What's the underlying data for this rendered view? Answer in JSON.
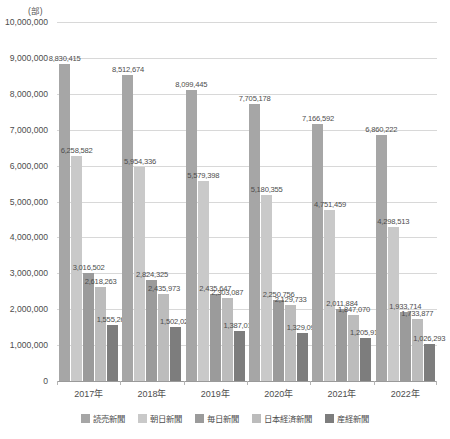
{
  "chart_data": {
    "type": "bar",
    "title": "",
    "subtitle": "",
    "unit_caption": "(部)",
    "xlabel": "",
    "ylabel": "",
    "ylim": [
      0,
      10000000
    ],
    "ytick_step": 1000000,
    "ytick_labels": [
      "10,000,000",
      "9,000,000",
      "8,000,000",
      "7,000,000",
      "6,000,000",
      "5,000,000",
      "4,000,000",
      "3,000,000",
      "2,000,000",
      "1,000,000",
      "0"
    ],
    "ytick_values": [
      10000000,
      9000000,
      8000000,
      7000000,
      6000000,
      5000000,
      4000000,
      3000000,
      2000000,
      1000000,
      0
    ],
    "grid": true,
    "legend_position": "bottom",
    "categories": [
      "2017年",
      "2018年",
      "2019年",
      "2020年",
      "2021年",
      "2022年"
    ],
    "series": [
      {
        "name": "読売新聞",
        "color": "#a6a6a6",
        "values": [
          8830415,
          8512674,
          8099445,
          7705178,
          7166592,
          6860222
        ],
        "labels": [
          "8,830,415",
          "8,512,674",
          "8,099,445",
          "7,705,178",
          "7,166,592",
          "6,860,222"
        ]
      },
      {
        "name": "朝日新聞",
        "color": "#c9c9c9",
        "values": [
          6258582,
          5954336,
          5579398,
          5180355,
          4751459,
          4298513
        ],
        "labels": [
          "6,258,582",
          "5,954,336",
          "5,579,398",
          "5,180,355",
          "4,751,459",
          "4,298,513"
        ]
      },
      {
        "name": "毎日新聞",
        "color": "#9b9b9b",
        "values": [
          3016502,
          2824325,
          2435647,
          2250756,
          2011884,
          1933714
        ],
        "labels": [
          "3,016,502",
          "2,824,325",
          "2,435,647",
          "2,250,756",
          "2,011,884",
          "1,933,714"
        ]
      },
      {
        "name": "日本経済新聞",
        "color": "#bcbcbc",
        "values": [
          2618263,
          2435973,
          2303087,
          2129733,
          1847070,
          1733877
        ],
        "labels": [
          "2,618,263",
          "2,435,973",
          "2,303,087",
          "2,129,733",
          "1,847,070",
          "1,733,877"
        ]
      },
      {
        "name": "産経新聞",
        "color": "#7d7d7d",
        "values": [
          1555261,
          1502020,
          1387011,
          1329094,
          1205916,
          1026293
        ],
        "labels": [
          "1,555,261",
          "1,502,020",
          "1,387,011",
          "1,329,094",
          "1,205,916",
          "1,026,293"
        ]
      }
    ]
  }
}
